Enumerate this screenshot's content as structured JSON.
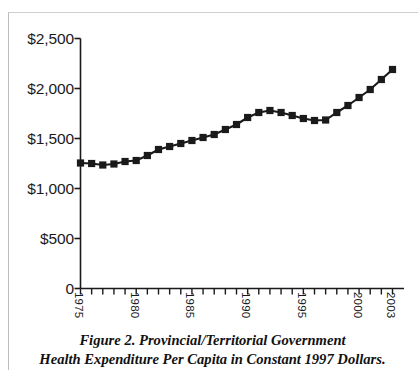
{
  "figure": {
    "caption_line1": "Figure 2. Provincial/Territorial Government",
    "caption_line2": "Health Expenditure Per Capita in Constant 1997 Dollars."
  },
  "colors": {
    "series": "#1a1a1a",
    "axis": "#1a1a1a",
    "frame": "#bdbdbd",
    "background": "#ffffff"
  },
  "chart_data": {
    "type": "line",
    "title": "",
    "subtitle": "",
    "xlabel": "",
    "ylabel": "",
    "grid": false,
    "legend": false,
    "legend_position": "none",
    "marker": "square",
    "ylim": [
      0,
      2500
    ],
    "ytick_values": [
      0,
      500,
      1000,
      1500,
      2000,
      2500
    ],
    "ytick_labels": [
      "0",
      "$500",
      "$1,000",
      "$1,500",
      "$2,000",
      "$2,500"
    ],
    "xlim": [
      1975,
      2003
    ],
    "xtick_values": [
      1975,
      1976,
      1977,
      1978,
      1979,
      1980,
      1981,
      1982,
      1983,
      1984,
      1985,
      1986,
      1987,
      1988,
      1989,
      1990,
      1991,
      1992,
      1993,
      1994,
      1995,
      1996,
      1997,
      1998,
      1999,
      2000,
      2001,
      2002,
      2003
    ],
    "xtick_labels_shown": [
      "1975",
      "1980",
      "1985",
      "1990",
      "1995",
      "2000",
      "2003"
    ],
    "series_name": "Provincial/Territorial Government Health Expenditure Per Capita (constant 1997 dollars)",
    "x": [
      1975,
      1976,
      1977,
      1978,
      1979,
      1980,
      1981,
      1982,
      1983,
      1984,
      1985,
      1986,
      1987,
      1988,
      1989,
      1990,
      1991,
      1992,
      1993,
      1994,
      1995,
      1996,
      1997,
      1998,
      1999,
      2000,
      2001,
      2002,
      2003
    ],
    "values": [
      1255,
      1250,
      1235,
      1245,
      1270,
      1280,
      1330,
      1390,
      1420,
      1450,
      1480,
      1510,
      1540,
      1590,
      1640,
      1710,
      1760,
      1780,
      1760,
      1730,
      1700,
      1680,
      1685,
      1760,
      1830,
      1910,
      1990,
      2090,
      2190
    ]
  }
}
